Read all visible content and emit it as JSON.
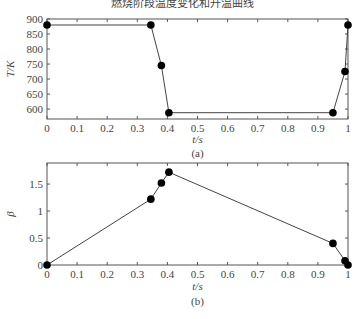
{
  "figure": {
    "title": "燃烧阶段温度变化和升温曲线"
  },
  "chart_data": [
    {
      "type": "line",
      "panel_label": "(a)",
      "xlabel": "t/s",
      "ylabel": "T/K",
      "xlim": [
        0,
        1
      ],
      "ylim": [
        567,
        900
      ],
      "x_ticks": [
        "0",
        "0.1",
        "0.2",
        "0.3",
        "0.4",
        "0.5",
        "0.6",
        "0.7",
        "0.8",
        "0.9",
        "1"
      ],
      "y_ticks": [
        "600",
        "650",
        "700",
        "750",
        "800",
        "850",
        "900"
      ],
      "grid": false,
      "marker": "filled-circle",
      "x": [
        0,
        0.345,
        0.38,
        0.405,
        0.95,
        0.99,
        1.0
      ],
      "y": [
        880,
        880,
        745,
        588,
        588,
        725,
        880
      ]
    },
    {
      "type": "line",
      "panel_label": "(b)",
      "xlabel": "t/s",
      "ylabel": "β",
      "xlim": [
        0,
        1
      ],
      "ylim": [
        0,
        1.89
      ],
      "x_ticks": [
        "0",
        "0.1",
        "0.2",
        "0.3",
        "0.4",
        "0.5",
        "0.6",
        "0.7",
        "0.8",
        "0.9",
        "1"
      ],
      "y_ticks": [
        "0",
        "0.5",
        "1",
        "1.5"
      ],
      "grid": false,
      "marker": "filled-circle",
      "x": [
        0,
        0.345,
        0.38,
        0.405,
        0.95,
        0.99,
        1.0
      ],
      "y": [
        0,
        1.22,
        1.52,
        1.72,
        0.4,
        0.08,
        0
      ]
    }
  ]
}
